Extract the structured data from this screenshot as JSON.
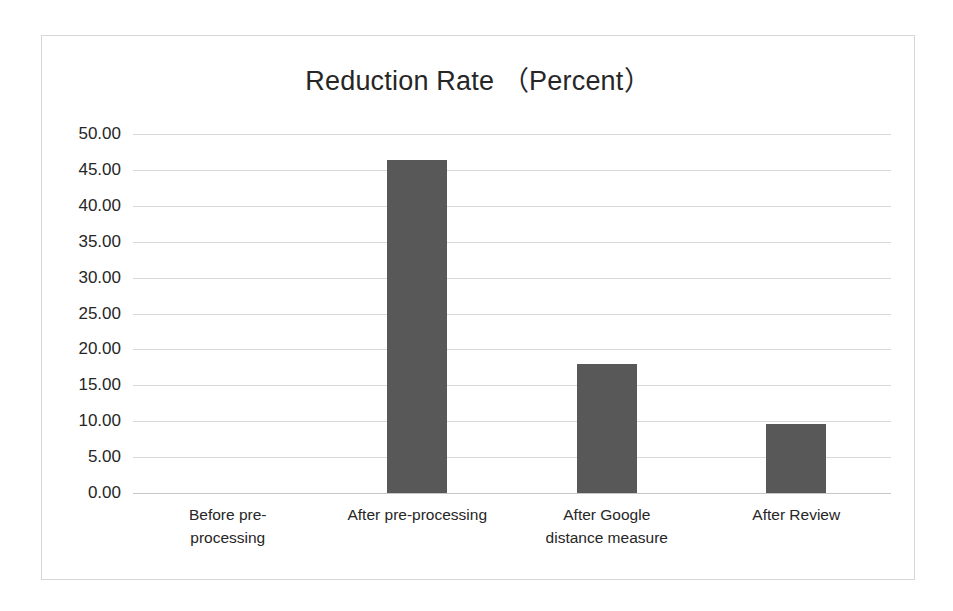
{
  "chart_data": {
    "type": "bar",
    "title": "Reduction Rate （Percent）",
    "xlabel": "",
    "ylabel": "",
    "categories": [
      "Before pre-processing",
      "After pre-processing",
      "After Google distance measure",
      "After Review"
    ],
    "category_lines": [
      [
        "Before pre-",
        "processing"
      ],
      [
        "After pre-processing"
      ],
      [
        "After Google",
        "distance measure"
      ],
      [
        "After Review"
      ]
    ],
    "values": [
      0.0,
      46.4,
      18.0,
      9.6
    ],
    "ylim": [
      0.0,
      50.0
    ],
    "ytick_step": 5.0,
    "ytick_labels": [
      "50.00",
      "45.00",
      "40.00",
      "35.00",
      "30.00",
      "25.00",
      "20.00",
      "15.00",
      "10.00",
      "5.00",
      "0.00"
    ],
    "ytick_values": [
      50,
      45,
      40,
      35,
      30,
      25,
      20,
      15,
      10,
      5,
      0
    ],
    "grid": true,
    "legend": false,
    "legend_position": "none",
    "bar_color": "#585858",
    "grid_color": "#d9d9d9",
    "plot_background": "#ffffff",
    "border_color": "#d6d6d6",
    "text_color": "#262626"
  }
}
